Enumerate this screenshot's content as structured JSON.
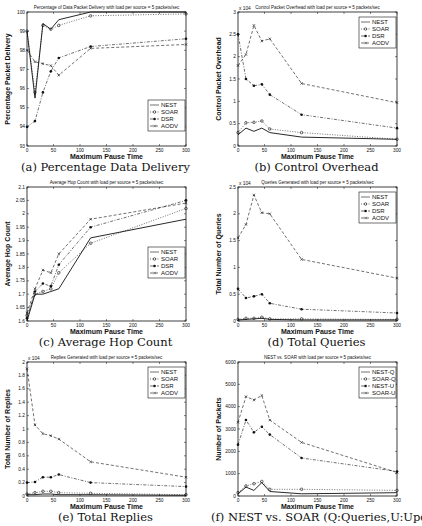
{
  "chart_data": [
    {
      "id": "a",
      "type": "line",
      "title": "Percentage of Data Packet Delivery with load per source = 5 packets/sec",
      "caption": "(a) Percentage Data Delivery",
      "xlabel": "Maximum Pause Time",
      "ylabel": "Percentage Packet Delivery",
      "x": [
        0,
        15,
        30,
        45,
        60,
        120,
        300
      ],
      "xlim": [
        0,
        300
      ],
      "xticks": [
        0,
        50,
        100,
        150,
        200,
        250,
        300
      ],
      "ylim": [
        93,
        100
      ],
      "yticks": [
        93,
        94,
        95,
        96,
        97,
        98,
        99,
        100
      ],
      "multiplier": "",
      "legend_position": "lower right",
      "grid": false,
      "series": [
        {
          "name": "NEST",
          "style": "solid",
          "marker": "",
          "values": [
            99.0,
            95.5,
            99.4,
            99.1,
            99.6,
            100.0,
            100.0
          ]
        },
        {
          "name": "SOAR",
          "style": "dotted",
          "marker": "o",
          "values": [
            99.0,
            95.8,
            99.3,
            99.1,
            99.3,
            99.8,
            99.9
          ]
        },
        {
          "name": "DSR",
          "style": "dashdot",
          "marker": "*",
          "values": [
            94.0,
            94.3,
            95.8,
            96.9,
            97.6,
            98.2,
            98.6
          ]
        },
        {
          "name": "AODV",
          "style": "dashed",
          "marker": "x",
          "values": [
            98.0,
            97.4,
            97.3,
            97.2,
            96.7,
            98.1,
            98.3
          ]
        }
      ]
    },
    {
      "id": "b",
      "type": "line",
      "title": "Control Packet Overhead with load per source = 5 packets/sec",
      "caption": "(b) Control Overhead",
      "xlabel": "Maximum Pause Time",
      "ylabel": "Control Packet Overhead",
      "x": [
        0,
        15,
        30,
        45,
        60,
        120,
        300
      ],
      "xlim": [
        0,
        300
      ],
      "xticks": [
        0,
        50,
        100,
        150,
        200,
        250,
        300
      ],
      "ylim": [
        0,
        3
      ],
      "yticks": [
        0,
        0.5,
        1,
        1.5,
        2,
        2.5,
        3
      ],
      "multiplier": "x 10^4",
      "legend_position": "upper right",
      "grid": false,
      "series": [
        {
          "name": "NEST",
          "style": "solid",
          "marker": "",
          "values": [
            0.25,
            0.4,
            0.33,
            0.4,
            0.3,
            0.2,
            0.15
          ]
        },
        {
          "name": "SOAR",
          "style": "dotted",
          "marker": "o",
          "values": [
            0.3,
            0.52,
            0.53,
            0.56,
            0.38,
            0.3,
            0.15
          ]
        },
        {
          "name": "DSR",
          "style": "dashdot",
          "marker": "*",
          "values": [
            2.5,
            1.5,
            1.35,
            1.38,
            1.15,
            0.7,
            0.4
          ]
        },
        {
          "name": "AODV",
          "style": "dashed",
          "marker": "x",
          "values": [
            1.8,
            2.05,
            2.7,
            2.35,
            2.4,
            1.4,
            0.97
          ]
        }
      ]
    },
    {
      "id": "c",
      "type": "line",
      "title": "Average Hop Count with load per source = 5 packets/sec",
      "caption": "(c) Average Hop Count",
      "xlabel": "Maximum Pause Time",
      "ylabel": "Average Hop Count",
      "x": [
        0,
        15,
        30,
        45,
        60,
        120,
        300
      ],
      "xlim": [
        0,
        300
      ],
      "xticks": [
        0,
        50,
        100,
        150,
        200,
        250,
        300
      ],
      "ylim": [
        1.6,
        2.1
      ],
      "yticks": [
        1.6,
        1.65,
        1.7,
        1.75,
        1.8,
        1.85,
        1.9,
        1.95,
        2.0,
        2.05,
        2.1
      ],
      "multiplier": "",
      "legend_position": "center right",
      "grid": false,
      "series": [
        {
          "name": "NEST",
          "style": "solid",
          "marker": "",
          "values": [
            1.6,
            1.7,
            1.7,
            1.71,
            1.72,
            1.91,
            1.98
          ]
        },
        {
          "name": "SOAR",
          "style": "dotted",
          "marker": "o",
          "values": [
            1.62,
            1.7,
            1.71,
            1.72,
            1.78,
            1.89,
            2.02
          ]
        },
        {
          "name": "DSR",
          "style": "dashdot",
          "marker": "*",
          "values": [
            1.61,
            1.71,
            1.74,
            1.73,
            1.81,
            1.95,
            2.05
          ]
        },
        {
          "name": "AODV",
          "style": "dashed",
          "marker": "x",
          "values": [
            1.63,
            1.72,
            1.79,
            1.78,
            1.85,
            1.98,
            2.04
          ]
        }
      ]
    },
    {
      "id": "d",
      "type": "line",
      "title": "Queries Generated with load per source = 5 packets/sec",
      "caption": "(d) Total Queries",
      "xlabel": "Maximum Pause Time",
      "ylabel": "Total Number of Queries",
      "x": [
        0,
        15,
        30,
        45,
        60,
        120,
        300
      ],
      "xlim": [
        0,
        300
      ],
      "xticks": [
        0,
        50,
        100,
        150,
        200,
        250,
        300
      ],
      "ylim": [
        0,
        2.5
      ],
      "yticks": [
        0,
        0.5,
        1,
        1.5,
        2,
        2.5
      ],
      "multiplier": "x 10^4",
      "legend_position": "upper right",
      "grid": false,
      "series": [
        {
          "name": "NEST",
          "style": "solid",
          "marker": "",
          "values": [
            0.02,
            0.03,
            0.04,
            0.05,
            0.03,
            0.02,
            0.02
          ]
        },
        {
          "name": "SOAR",
          "style": "dotted",
          "marker": "o",
          "values": [
            0.03,
            0.05,
            0.05,
            0.07,
            0.04,
            0.04,
            0.03
          ]
        },
        {
          "name": "DSR",
          "style": "dashdot",
          "marker": "*",
          "values": [
            0.6,
            0.43,
            0.46,
            0.5,
            0.33,
            0.22,
            0.15
          ]
        },
        {
          "name": "AODV",
          "style": "dashed",
          "marker": "x",
          "values": [
            1.55,
            1.8,
            2.35,
            2.02,
            2.0,
            1.15,
            0.8
          ]
        }
      ]
    },
    {
      "id": "e",
      "type": "line",
      "title": "Replies Generated with load per source = 5 packets/sec",
      "caption": "(e) Total Replies",
      "xlabel": "Maximum Pause Time",
      "ylabel": "Total Number of Replies",
      "x": [
        0,
        15,
        30,
        45,
        60,
        120,
        300
      ],
      "xlim": [
        0,
        300
      ],
      "xticks": [
        0,
        50,
        100,
        150,
        200,
        250,
        300
      ],
      "ylim": [
        0,
        2
      ],
      "yticks": [
        0,
        0.2,
        0.4,
        0.6,
        0.8,
        1.0,
        1.2,
        1.4,
        1.6,
        1.8,
        2.0
      ],
      "multiplier": "x 10^4",
      "legend_position": "upper right",
      "grid": false,
      "series": [
        {
          "name": "NEST",
          "style": "solid",
          "marker": "",
          "values": [
            0.02,
            0.02,
            0.03,
            0.03,
            0.02,
            0.02,
            0.01
          ]
        },
        {
          "name": "SOAR",
          "style": "dotted",
          "marker": "o",
          "values": [
            0.03,
            0.05,
            0.07,
            0.07,
            0.05,
            0.04,
            0.02
          ]
        },
        {
          "name": "DSR",
          "style": "dashdot",
          "marker": "*",
          "values": [
            0.2,
            0.21,
            0.28,
            0.28,
            0.32,
            0.2,
            0.14
          ]
        },
        {
          "name": "AODV",
          "style": "dashed",
          "marker": "x",
          "values": [
            1.9,
            1.06,
            0.93,
            0.9,
            0.85,
            0.51,
            0.28
          ]
        }
      ]
    },
    {
      "id": "f",
      "type": "line",
      "title": "NEST vs. SOAR with load per source = 5 packets/sec",
      "caption": "(f) NEST vs. SOAR (Q:Queries,U:Updates)",
      "xlabel": "Maximum Pause Time",
      "ylabel": "Number of Packets",
      "x": [
        0,
        15,
        30,
        45,
        60,
        120,
        300
      ],
      "xlim": [
        0,
        300
      ],
      "xticks": [
        0,
        50,
        100,
        150,
        200,
        250,
        300
      ],
      "ylim": [
        0,
        6000
      ],
      "yticks": [
        0,
        1000,
        2000,
        3000,
        4000,
        5000,
        6000
      ],
      "multiplier": "",
      "legend_position": "upper right",
      "grid": false,
      "series": [
        {
          "name": "NEST-Q",
          "style": "solid",
          "marker": "",
          "values": [
            100,
            400,
            250,
            600,
            200,
            100,
            150
          ]
        },
        {
          "name": "SOAR-Q",
          "style": "dotted",
          "marker": "o",
          "values": [
            150,
            450,
            550,
            650,
            300,
            300,
            250
          ]
        },
        {
          "name": "NEST-U",
          "style": "dashdot",
          "marker": "*",
          "values": [
            2300,
            3400,
            2850,
            3100,
            2750,
            1700,
            1100
          ]
        },
        {
          "name": "SOAR-U",
          "style": "dashed",
          "marker": "x",
          "values": [
            3300,
            4450,
            4300,
            4500,
            3400,
            2400,
            1050
          ]
        }
      ]
    }
  ]
}
